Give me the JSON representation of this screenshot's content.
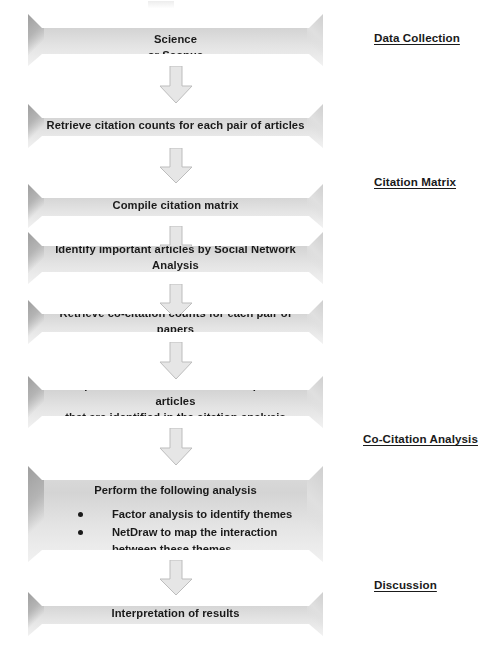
{
  "diagram": {
    "colors": {
      "box_fill_top": "#dcdcdc",
      "box_fill_bottom": "#f1f1f1",
      "box_shadow_edge": "#9e9e9e",
      "arrow_fill": "#e3e3e3",
      "arrow_stroke": "#b8b8b8",
      "text": "#1a1a1a",
      "background": "#ffffff"
    },
    "steps": [
      {
        "id": "collect-articles",
        "text": "Collect articles from database like Web of Science or Scopus",
        "lines": [
          "Collect articles from database like Web of Science",
          "or Scopus"
        ]
      },
      {
        "id": "retrieve-citation-counts",
        "text": "Retrieve citation counts for each pair of articles",
        "lines": [
          "Retrieve citation counts for each pair of articles"
        ]
      },
      {
        "id": "compile-citation-matrix",
        "text": "Compile citation matrix",
        "lines": [
          "Compile citation matrix"
        ]
      },
      {
        "id": "identify-important-articles",
        "text": "Identify important articles by Social Network Analysis",
        "lines": [
          "Identify important articles by Social Network",
          "Analysis"
        ]
      },
      {
        "id": "retrieve-cocitation-counts",
        "text": "Retrieve co-citation counts for each pair of papers",
        "lines": [
          "Retrieve co-citation counts for each pair of papers"
        ]
      },
      {
        "id": "compile-cocitation-matrix",
        "text": "Compile co-citation matrix of the important articles that are identified in the citation analysis",
        "lines": [
          "Compile co-citation matrix of the important articles",
          "that are identified in the citation analysis"
        ]
      },
      {
        "id": "perform-analysis",
        "title": "Perform the following analysis",
        "bullets": [
          "Factor analysis to identify themes",
          "NetDraw to map the interaction between these themes"
        ]
      },
      {
        "id": "interpretation-of-results",
        "text": "Interpretation of results",
        "lines": [
          "Interpretation of results"
        ]
      }
    ],
    "arrows": [
      {
        "id": "arrow-1",
        "from": "collect-articles",
        "to": "retrieve-citation-counts",
        "direction": "down"
      },
      {
        "id": "arrow-2",
        "from": "retrieve-citation-counts",
        "to": "compile-citation-matrix",
        "direction": "down"
      },
      {
        "id": "arrow-3",
        "from": "compile-citation-matrix",
        "to": "identify-important-articles",
        "direction": "down"
      },
      {
        "id": "arrow-4",
        "from": "identify-important-articles",
        "to": "retrieve-cocitation-counts",
        "direction": "down"
      },
      {
        "id": "arrow-5",
        "from": "retrieve-cocitation-counts",
        "to": "compile-cocitation-matrix",
        "direction": "down"
      },
      {
        "id": "arrow-6",
        "from": "compile-cocitation-matrix",
        "to": "perform-analysis",
        "direction": "down"
      },
      {
        "id": "arrow-7",
        "from": "perform-analysis",
        "to": "interpretation-of-results",
        "direction": "down"
      }
    ],
    "stage_labels": [
      {
        "id": "data-collection",
        "label": "Data Collection"
      },
      {
        "id": "citation-matrix",
        "label": "Citation Matrix"
      },
      {
        "id": "co-citation-analysis",
        "label": "Co-Citation Analysis"
      },
      {
        "id": "discussion",
        "label": "Discussion"
      }
    ]
  }
}
